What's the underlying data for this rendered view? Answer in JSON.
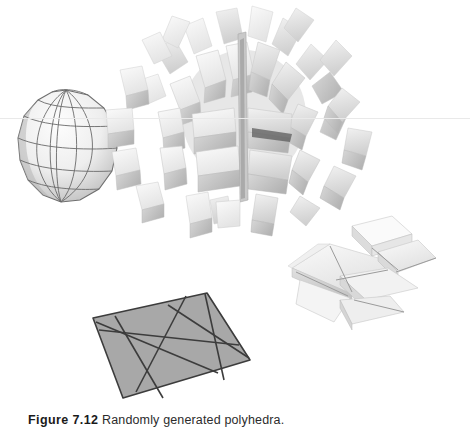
{
  "figure": {
    "caption_label": "Figure 7.12",
    "caption_text": "Randomly generated polyhedra.",
    "background_color": "#ffffff",
    "page_width": 470,
    "page_height": 430,
    "scan_artifact": {
      "name": "horizontal-scan-line",
      "y": 118,
      "color": "#e9e9e9"
    },
    "palette": {
      "paper_white": "#ffffff",
      "quad_fill": "#a8a8a8",
      "quad_edge": "#3c3c3c",
      "sphere_fill_light": "#f2f2f2",
      "sphere_fill_mid": "#e2e2e2",
      "sphere_fill_shade": "#b6b6b6",
      "sphere_edge": "#6e6e6e",
      "spike_light": "#f4f4f4",
      "spike_mid": "#dedede",
      "spike_dark": "#b9b9b9",
      "spike_shadow": "#8e8e8e",
      "terrain_light": "#f6f6f6",
      "terrain_mid": "#e6e6e6",
      "terrain_dark": "#cfcfcf",
      "terrain_edge": "#9b9b9b"
    },
    "objects": [
      {
        "id": "sphere",
        "name": "wireframe-sphere",
        "label": "Wireframe sphere with latitude and longitude subdivision",
        "center_x": 66,
        "center_y": 146,
        "radius_x": 49,
        "radius_y": 56,
        "latitude_bands": 7,
        "longitude_segments": 12
      },
      {
        "id": "spiky",
        "name": "extruded-spiky-polyhedron",
        "label": "Sphere with randomly extruded faces",
        "center_x": 243,
        "center_y": 115,
        "radius": 100,
        "spike_count": 46
      },
      {
        "id": "terrain",
        "name": "extruded-plane-fragments",
        "label": "Plane subdivided by random cuts with extruded fragments",
        "center_x": 368,
        "center_y": 270
      },
      {
        "id": "quad",
        "name": "subdivided-quad-plane",
        "label": "Flat quadrilateral cut by random lines",
        "corners": [
          [
            93,
            318
          ],
          [
            207,
            293
          ],
          [
            250,
            360
          ],
          [
            123,
            398
          ]
        ],
        "cut_count": 6
      }
    ]
  }
}
